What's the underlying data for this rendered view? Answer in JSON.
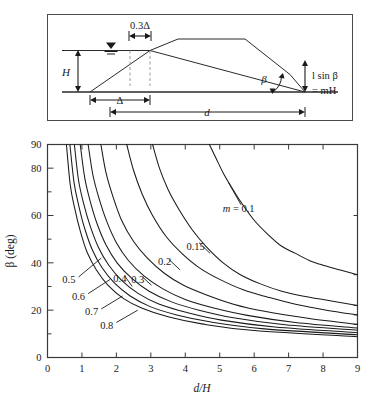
{
  "figure": {
    "title_caption": "",
    "panels": [
      "definition-sketch",
      "design-chart"
    ]
  },
  "sketch": {
    "labels": {
      "crest_offset": "0.3Δ",
      "height": "H",
      "base_width": "Δ",
      "distance": "d",
      "angle": "β",
      "rise": "l sin β",
      "rise_equals": "= mH",
      "water_table_icon": "water-table-symbol"
    }
  },
  "chart_data": {
    "type": "line",
    "title": "",
    "xlabel": "d/H",
    "ylabel": "β (deg)",
    "xlim": [
      0,
      9
    ],
    "ylim": [
      0,
      90
    ],
    "xticks": [
      0,
      1,
      2,
      3,
      4,
      5,
      6,
      7,
      8,
      9
    ],
    "yticks": [
      0,
      20,
      40,
      60,
      80,
      90
    ],
    "y_minor_ticks": [
      10,
      30,
      50,
      70
    ],
    "grid": false,
    "legend": "inline-curve-labels",
    "legend_prefix": "m = ",
    "series": [
      {
        "name": "m = 0.1",
        "label": "m = 0.1",
        "label_text": "0.1",
        "m": 0.1,
        "x": [
          4.7,
          4.9,
          5.1,
          5.3,
          5.6,
          6.0,
          6.4,
          6.8,
          7.2,
          7.6,
          8.0,
          8.5,
          9.0
        ],
        "y": [
          90.0,
          84.0,
          78.0,
          73.0,
          66.0,
          58.0,
          52.0,
          47.0,
          44.0,
          41.0,
          39.0,
          37.0,
          35.0
        ]
      },
      {
        "name": "m = 0.15",
        "label": "0.15",
        "label_text": "0.15",
        "m": 0.15,
        "x": [
          3.05,
          3.25,
          3.5,
          3.8,
          4.2,
          4.6,
          5.1,
          5.6,
          6.2,
          6.8,
          7.4,
          8.2,
          9.0
        ],
        "y": [
          90.0,
          80.0,
          71.0,
          63.0,
          54.0,
          47.0,
          40.0,
          35.0,
          31.0,
          28.0,
          26.0,
          24.0,
          22.0
        ]
      },
      {
        "name": "m = 0.2",
        "label": "0.2",
        "label_text": "0.2",
        "m": 0.2,
        "x": [
          2.3,
          2.5,
          2.75,
          3.05,
          3.45,
          3.9,
          4.4,
          5.0,
          5.7,
          6.4,
          7.2,
          8.1,
          9.0
        ],
        "y": [
          90.0,
          79.0,
          69.0,
          60.0,
          51.0,
          44.0,
          38.0,
          33.0,
          28.5,
          25.5,
          22.5,
          20.0,
          18.0
        ]
      },
      {
        "name": "m = 0.3",
        "label": "0.3",
        "label_text": "0.3",
        "m": 0.3,
        "x": [
          1.55,
          1.7,
          1.9,
          2.15,
          2.5,
          2.9,
          3.4,
          3.95,
          4.6,
          5.4,
          6.3,
          7.6,
          9.0
        ],
        "y": [
          90.0,
          78.0,
          68.0,
          58.0,
          49.0,
          42.0,
          35.5,
          30.5,
          26.5,
          22.5,
          19.5,
          16.5,
          14.0
        ]
      },
      {
        "name": "m = 0.4",
        "label": "0.4",
        "label_text": "0.4",
        "m": 0.4,
        "x": [
          1.18,
          1.32,
          1.5,
          1.72,
          2.0,
          2.35,
          2.8,
          3.35,
          4.0,
          4.8,
          5.8,
          7.2,
          9.0
        ],
        "y": [
          90.0,
          77.0,
          67.0,
          57.5,
          48.5,
          41.0,
          34.5,
          29.0,
          24.5,
          21.0,
          17.8,
          14.8,
          12.5
        ]
      },
      {
        "name": "m = 0.5",
        "label": "0.5",
        "label_text": "0.5",
        "m": 0.5,
        "x": [
          0.95,
          1.08,
          1.24,
          1.44,
          1.7,
          2.02,
          2.44,
          2.95,
          3.6,
          4.4,
          5.4,
          6.9,
          9.0
        ],
        "y": [
          90.0,
          76.0,
          66.0,
          56.5,
          47.5,
          40.0,
          33.5,
          28.0,
          23.5,
          20.0,
          16.8,
          13.8,
          11.5
        ]
      },
      {
        "name": "m = 0.6",
        "label": "0.6",
        "label_text": "0.6",
        "m": 0.6,
        "x": [
          0.78,
          0.9,
          1.05,
          1.24,
          1.48,
          1.78,
          2.16,
          2.64,
          3.25,
          4.05,
          5.05,
          6.6,
          9.0
        ],
        "y": [
          90.0,
          75.0,
          65.0,
          55.5,
          46.5,
          39.0,
          32.5,
          27.0,
          22.5,
          19.0,
          15.8,
          12.9,
          10.5
        ]
      },
      {
        "name": "m = 0.7",
        "label": "0.7",
        "label_text": "0.7",
        "m": 0.7,
        "x": [
          0.65,
          0.77,
          0.91,
          1.08,
          1.3,
          1.58,
          1.94,
          2.4,
          2.98,
          3.75,
          4.75,
          6.3,
          9.0
        ],
        "y": [
          90.0,
          74.0,
          64.0,
          54.5,
          45.5,
          38.0,
          31.5,
          26.0,
          21.5,
          18.0,
          15.0,
          12.1,
          9.6
        ]
      },
      {
        "name": "m = 0.8",
        "label": "0.8",
        "label_text": "0.8",
        "m": 0.8,
        "x": [
          0.55,
          0.66,
          0.79,
          0.95,
          1.15,
          1.42,
          1.76,
          2.2,
          2.75,
          3.5,
          4.48,
          6.0,
          9.0
        ],
        "y": [
          90.0,
          73.0,
          63.0,
          53.5,
          44.5,
          37.0,
          30.5,
          25.0,
          20.8,
          17.2,
          14.2,
          11.4,
          8.8
        ]
      }
    ],
    "annotations": [
      {
        "text": "m = 0.1",
        "x": 5.55,
        "y": 61.5
      },
      {
        "text": "0.15",
        "x": 4.3,
        "y": 45.5
      },
      {
        "text": "0.2",
        "x": 3.4,
        "y": 39.0
      },
      {
        "text": "0.3",
        "x": 2.62,
        "y": 31.5
      },
      {
        "text": "0.4",
        "x": 2.1,
        "y": 32.0
      },
      {
        "text": "0.5",
        "x": 0.62,
        "y": 31.5
      },
      {
        "text": "0.6",
        "x": 0.9,
        "y": 24.5
      },
      {
        "text": "0.7",
        "x": 1.28,
        "y": 18.0
      },
      {
        "text": "0.8",
        "x": 1.72,
        "y": 12.2
      }
    ]
  }
}
